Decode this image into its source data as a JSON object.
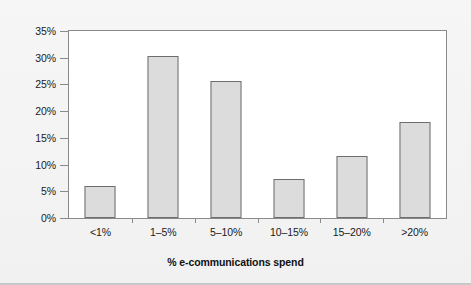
{
  "chart_data": {
    "type": "bar",
    "title": "",
    "subtitle": "",
    "xlabel": "% e-communications spend",
    "ylabel": "",
    "categories": [
      "<1%",
      "1–5%",
      "5–10%",
      "10–15%",
      "15–20%",
      ">20%"
    ],
    "values": [
      6.0,
      30.3,
      25.7,
      7.3,
      11.7,
      17.9
    ],
    "ylim": [
      0,
      35
    ],
    "ytick_values": [
      0,
      5,
      10,
      15,
      20,
      25,
      30,
      35
    ],
    "ytick_labels": [
      "0%",
      "5%",
      "10%",
      "15%",
      "20%",
      "25%",
      "30%",
      "35%"
    ],
    "grid": false,
    "legend": null,
    "legend_position": "none",
    "series": [
      {
        "name": "% of respondents",
        "values": [
          6.0,
          30.3,
          25.7,
          7.3,
          11.7,
          17.9
        ]
      }
    ],
    "colors": {
      "bar_fill": "#dcdcdc",
      "bar_edge": "#6e6e6e",
      "plot_background": "#ffffff",
      "figure_background": "#f4f4f4",
      "axis_line": "#8a8a8a",
      "text": "#1a1a1a"
    }
  }
}
